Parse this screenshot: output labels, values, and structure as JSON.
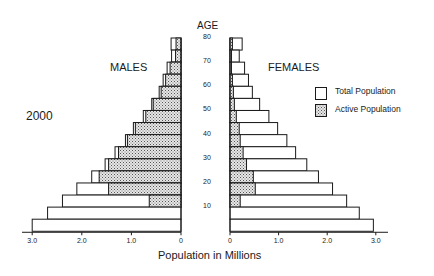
{
  "chart_data": {
    "type": "bar",
    "subtype": "population-pyramid",
    "title": "2000",
    "center_axis_label": "AGE",
    "xlabel": "Population in Millions",
    "ylabel": "AGE",
    "side_labels": {
      "left": "MALES",
      "right": "FEMALES"
    },
    "xlim": [
      0,
      3.0
    ],
    "x_ticks": [
      "3.0",
      "2.0",
      "1.0",
      "0"
    ],
    "x_ticks_right": [
      "0",
      "1.0",
      "2.0",
      "3.0"
    ],
    "age_tick_labels": [
      "80",
      "70",
      "60",
      "50",
      "40",
      "30",
      "20",
      "10"
    ],
    "grid": false,
    "legend": {
      "position": "right",
      "entries": [
        {
          "label": "Total Population",
          "pattern": "blank"
        },
        {
          "label": "Active Population",
          "pattern": "stippled"
        }
      ]
    },
    "categories": [
      "80+",
      "75",
      "70",
      "65",
      "60",
      "55",
      "50",
      "45",
      "40",
      "35",
      "30",
      "25",
      "20",
      "15",
      "10",
      "5"
    ],
    "series": [
      {
        "name": "Males Total Population",
        "values": [
          0.2,
          0.19,
          0.28,
          0.36,
          0.44,
          0.59,
          0.76,
          0.96,
          1.12,
          1.33,
          1.53,
          1.8,
          2.1,
          2.39,
          2.69,
          3.0
        ]
      },
      {
        "name": "Males Active Population",
        "values": [
          0.1,
          0.11,
          0.22,
          0.31,
          0.4,
          0.56,
          0.71,
          0.92,
          1.08,
          1.26,
          1.46,
          1.65,
          1.46,
          0.64,
          0,
          0
        ]
      },
      {
        "name": "Females Total Population",
        "values": [
          0.25,
          0.19,
          0.3,
          0.38,
          0.46,
          0.61,
          0.8,
          0.98,
          1.17,
          1.35,
          1.58,
          1.82,
          2.11,
          2.4,
          2.66,
          2.95
        ]
      },
      {
        "name": "Females Active Population",
        "values": [
          0.05,
          0.03,
          0.03,
          0.05,
          0.07,
          0.09,
          0.13,
          0.19,
          0.21,
          0.27,
          0.34,
          0.48,
          0.52,
          0.21,
          0,
          0
        ]
      }
    ]
  },
  "colors": {
    "ink": "#1a1a1a",
    "background": "#ffffff",
    "stipple_fill": "#d8d8d8"
  }
}
